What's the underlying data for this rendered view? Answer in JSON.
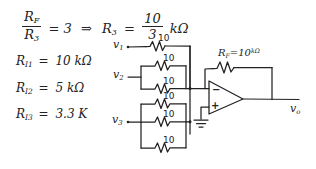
{
  "document": {
    "kind": "handwritten-circuit-notes",
    "background_color": "#ffffff",
    "ink_color": "#222222"
  },
  "equations": {
    "ratio": {
      "numerator": "R",
      "numerator_sub": "F",
      "denominator": "R",
      "denominator_sub": "3",
      "equals": "= 3",
      "implies": "⇒",
      "result_symbol": "R",
      "result_sub": "3",
      "result_eq": "=",
      "result_frac_num": "10",
      "result_frac_den": "3",
      "result_unit": "kΩ"
    },
    "resistor_list": [
      {
        "symbol": "R",
        "subscript": "I1",
        "equals": "=",
        "value": "10 kΩ"
      },
      {
        "symbol": "R",
        "subscript": "I2",
        "equals": "=",
        "value": "5 kΩ"
      },
      {
        "symbol": "R",
        "subscript": "I3",
        "equals": "=",
        "value": "3.3 K"
      }
    ]
  },
  "circuit": {
    "title": "inverting summing amplifier",
    "inputs": [
      {
        "label": "v",
        "subscript": "1",
        "parallel_resistors": 1,
        "resistor_value": "10"
      },
      {
        "label": "v",
        "subscript": "2",
        "parallel_resistors": 2,
        "resistor_value": "10"
      },
      {
        "label": "v",
        "subscript": "3",
        "parallel_resistors": 3,
        "resistor_value": "10"
      }
    ],
    "feedback": {
      "symbol": "R",
      "subscript": "F",
      "equals": "=",
      "value": "10",
      "unit": "kΩ"
    },
    "opamp": {
      "inverting_terminal": "−",
      "noninverting_terminal": "+",
      "ground": "ground-symbol"
    },
    "output": {
      "label": "v",
      "subscript": "o"
    },
    "resistor_labels": {
      "r1": "10",
      "r2a": "10",
      "r2b": "10",
      "r3a": "10",
      "r3b": "10",
      "r3c": "10"
    }
  }
}
